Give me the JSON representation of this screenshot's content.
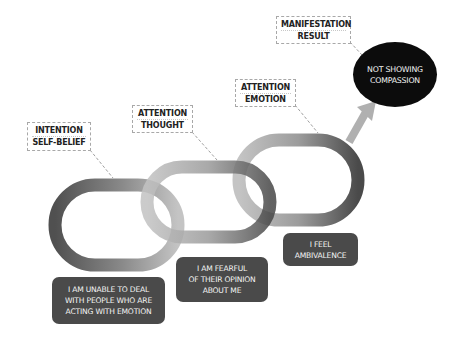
{
  "diagram": {
    "stages": [
      {
        "label_top": "INTENTION",
        "label_bottom": "SELF-BELIEF",
        "statement_lines": [
          "I AM UNABLE TO DEAL",
          "WITH PEOPLE WHO ARE",
          "ACTING WITH EMOTION"
        ]
      },
      {
        "label_top": "ATTENTION",
        "label_bottom": "THOUGHT",
        "statement_lines": [
          "I AM FEARFUL",
          "OF THEIR OPINION",
          "ABOUT ME"
        ]
      },
      {
        "label_top": "ATTENTION",
        "label_bottom": "EMOTION",
        "statement_lines": [
          "I FEEL",
          "AMBIVALENCE"
        ]
      }
    ],
    "result": {
      "label_top": "MANIFESTATION",
      "label_bottom": "RESULT",
      "lines": [
        "NOT SHOWING",
        "COMPASSION"
      ]
    },
    "colors": {
      "ring_dark": "#4e4e4e",
      "ring_light": "#b9b9b9",
      "statement_bg": "#4a4a4a",
      "result_bg": "#0c0c0c",
      "arrow": "#b0b0b0",
      "dashed_border": "#a8a8a8"
    }
  }
}
